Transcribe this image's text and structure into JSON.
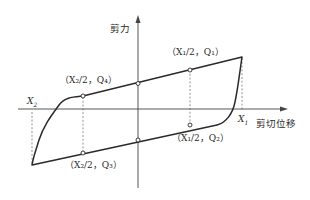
{
  "diagram": {
    "title": "",
    "axes": {
      "y_label": "剪力",
      "x_label": "剪切位移"
    },
    "points": {
      "x1": "X",
      "x1_sub": "1",
      "x2": "X",
      "x2_sub": "2"
    },
    "annotations": [
      {
        "id": "q1",
        "text": "（X₁/2，Q₁）"
      },
      {
        "id": "q2",
        "text": "（X₁/2，Q₂）"
      },
      {
        "id": "q3",
        "text": "（X₂/2，Q₃）"
      },
      {
        "id": "q4",
        "text": "（X₂/2，Q₄）"
      }
    ],
    "colors": {
      "line": "#2a2a2a",
      "dashed": "#666666",
      "axis": "#444444"
    }
  }
}
